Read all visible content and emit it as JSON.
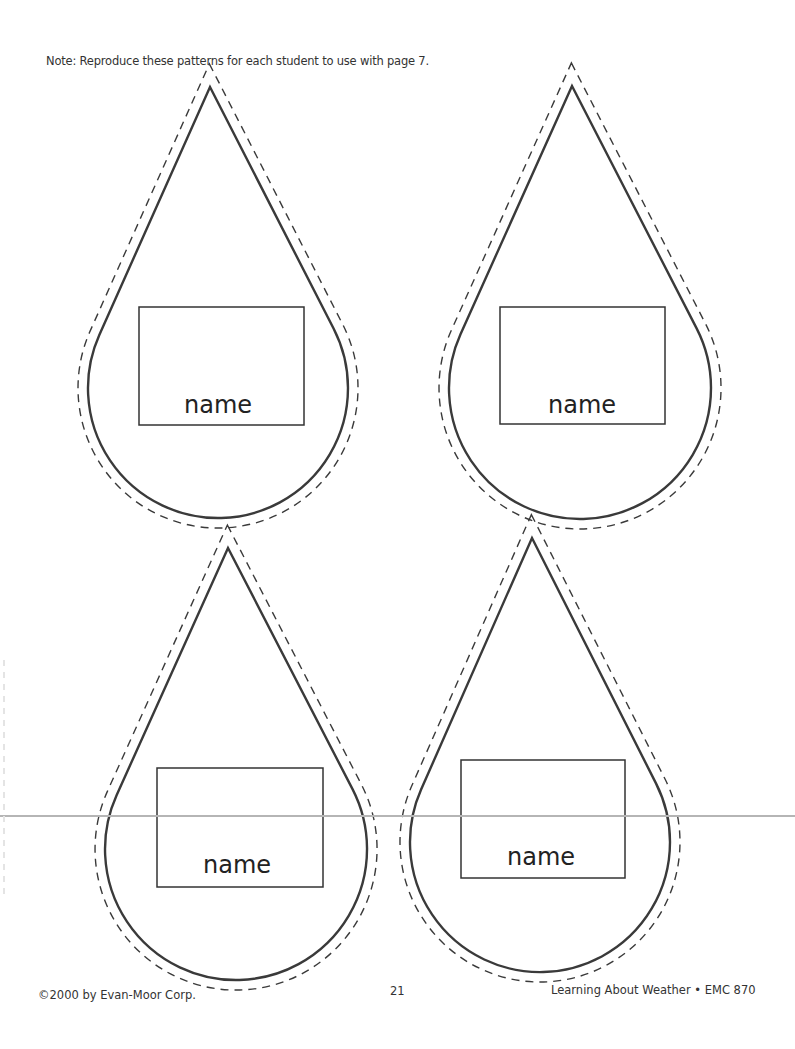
{
  "header": {
    "note": "Note: Reproduce these patterns for each student to use with page 7."
  },
  "drops": [
    {
      "label": "name",
      "tip": [
        210,
        87
      ],
      "center": [
        218,
        388
      ],
      "r": 130,
      "box": [
        139,
        307,
        165,
        118
      ],
      "label_pos": [
        218,
        413
      ]
    },
    {
      "label": "name",
      "tip": [
        572,
        86
      ],
      "center": [
        580,
        388
      ],
      "r": 131,
      "box": [
        500,
        307,
        165,
        117
      ],
      "label_pos": [
        582,
        413
      ]
    },
    {
      "label": "name",
      "tip": [
        228,
        548
      ],
      "center": [
        236,
        849
      ],
      "r": 131,
      "box": [
        157,
        768,
        166,
        119
      ],
      "label_pos": [
        237,
        873
      ]
    },
    {
      "label": "name",
      "tip": [
        532,
        538
      ],
      "center": [
        540,
        842
      ],
      "r": 130,
      "box": [
        461,
        760,
        164,
        118
      ],
      "label_pos": [
        541,
        865
      ]
    }
  ],
  "footer": {
    "copyright": "©2000 by Evan-Moor Corp.",
    "page_number": "21",
    "book_title": "Learning About Weather • EMC 870"
  },
  "colors": {
    "ink": "#3a3a3a",
    "paper": "#ffffff",
    "fold_line": "#b5b5b5"
  }
}
